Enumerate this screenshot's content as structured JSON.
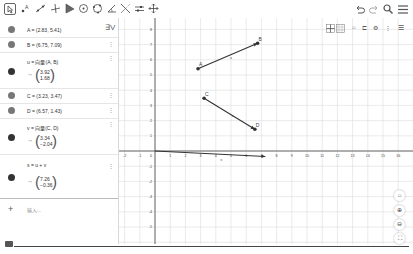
{
  "toolbar": {
    "tools": [
      {
        "name": "move-tool-icon",
        "glyph": "⇱",
        "selected": true
      },
      {
        "name": "point-tool-icon",
        "glyph": "•A"
      },
      {
        "name": "line-tool-icon",
        "glyph": "⟋"
      },
      {
        "name": "perpendicular-tool-icon",
        "glyph": "⊥"
      },
      {
        "name": "polygon-tool-icon",
        "glyph": "▶"
      },
      {
        "name": "circle-tool-icon",
        "glyph": "⊙"
      },
      {
        "name": "circle-three-points-tool-icon",
        "glyph": "✪"
      },
      {
        "name": "angle-tool-icon",
        "glyph": "∡"
      },
      {
        "name": "reflect-tool-icon",
        "glyph": "⤫"
      },
      {
        "name": "slider-tool-icon",
        "glyph": "⇄"
      },
      {
        "name": "move-view-tool-icon",
        "glyph": "✥"
      }
    ],
    "right": [
      {
        "name": "undo-icon",
        "glyph": "↶"
      },
      {
        "name": "redo-icon",
        "glyph": "↷"
      },
      {
        "name": "search-icon",
        "glyph": "🔍"
      },
      {
        "name": "menu-icon",
        "glyph": "☰"
      }
    ]
  },
  "algebra": {
    "sort_label": "∃V",
    "items": [
      {
        "text": "A = (2.83, 5.41)"
      },
      {
        "text": "B = (6.75, 7.09)"
      },
      {
        "text": "u = 向量(A, B)",
        "vector": [
          "3.92",
          "1.68"
        ]
      },
      {
        "text": "C = (3.23, 3.47)"
      },
      {
        "text": "D = (6.57, 1.43)"
      },
      {
        "text": "v = 向量(C, D)",
        "vector": [
          "3.34",
          "−2.04"
        ]
      },
      {
        "text": "s = u + v",
        "vector": [
          "7.26",
          "−0.36"
        ]
      }
    ],
    "arrow": "→",
    "input_placeholder": "输入...",
    "plus": "+"
  },
  "graphics": {
    "x_ticks": [
      "-2",
      "-1",
      "0",
      "1",
      "2",
      "3",
      "4",
      "5",
      "6",
      "7",
      "8",
      "9",
      "10",
      "11",
      "12",
      "13",
      "14",
      "15",
      "16"
    ],
    "y_ticks": [
      "8",
      "7",
      "6",
      "5",
      "4",
      "3",
      "2",
      "1",
      "-1",
      "-2",
      "-3",
      "-4",
      "-5"
    ],
    "points": [
      {
        "label": "A",
        "x": 2.83,
        "y": 5.41
      },
      {
        "label": "B",
        "x": 6.75,
        "y": 7.09
      },
      {
        "label": "C",
        "x": 3.23,
        "y": 3.47
      },
      {
        "label": "D",
        "x": 6.57,
        "y": 1.43
      }
    ],
    "vectors": [
      {
        "label": "u",
        "from": [
          2.83,
          5.41
        ],
        "to": [
          6.75,
          7.09
        ]
      },
      {
        "label": "v",
        "from": [
          3.23,
          3.47
        ],
        "to": [
          6.57,
          1.43
        ]
      },
      {
        "label": "s",
        "from": [
          0,
          0
        ],
        "to": [
          7.26,
          -0.36
        ]
      }
    ],
    "stylebar": [
      "grid-axes-icon",
      "grid-icon",
      "home-view-icon",
      "mode-icon",
      "point-style-icon",
      "more-icon",
      "graphics-menu-icon"
    ],
    "zoom_buttons": [
      {
        "name": "home-button",
        "glyph": "⌂"
      },
      {
        "name": "zoom-in-button",
        "glyph": "⊕"
      },
      {
        "name": "zoom-out-button",
        "glyph": "⊖"
      },
      {
        "name": "fullscreen-button",
        "glyph": "⛶"
      }
    ]
  }
}
